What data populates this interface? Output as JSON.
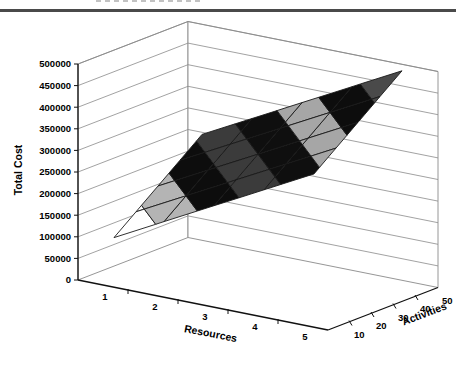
{
  "header": {
    "rule_color": "#4a4a4a"
  },
  "chart_data": {
    "type": "surface",
    "title": "",
    "xlabel": "Resources",
    "ylabel": "Activities",
    "zlabel": "Total Cost",
    "x_categories": [
      "1",
      "2",
      "3",
      "4",
      "5"
    ],
    "y_categories": [
      "10",
      "20",
      "30",
      "40",
      "50"
    ],
    "z_ticks": [
      "0",
      "50000",
      "100000",
      "150000",
      "200000",
      "250000",
      "300000",
      "350000",
      "400000",
      "450000",
      "500000"
    ],
    "zlim": [
      0,
      500000
    ],
    "band_size": 50000,
    "grid": true,
    "legend": "none",
    "series": [
      {
        "name": "10",
        "values": [
          100000,
          160000,
          220000,
          280000,
          340000
        ]
      },
      {
        "name": "20",
        "values": [
          140000,
          200000,
          260000,
          320000,
          380000
        ]
      },
      {
        "name": "30",
        "values": [
          180000,
          240000,
          300000,
          360000,
          420000
        ]
      },
      {
        "name": "40",
        "values": [
          220000,
          280000,
          340000,
          400000,
          460000
        ]
      },
      {
        "name": "50",
        "values": [
          260000,
          320000,
          380000,
          440000,
          500000
        ]
      }
    ],
    "band_colors": {
      "2": "#ffffff",
      "3": "#b4b4b4",
      "4": "#0d0d0d",
      "5": "#3b3b3b",
      "6": "#0f0f0f",
      "7": "#a6a6a6",
      "8": "#0d0d0d",
      "9": "#4a4a4a"
    },
    "colors": {
      "axis": "#111111",
      "grid": "#8a8a8a",
      "mesh_line": "#1a1a1a",
      "wall": "#ffffff",
      "text": "#000000"
    }
  }
}
